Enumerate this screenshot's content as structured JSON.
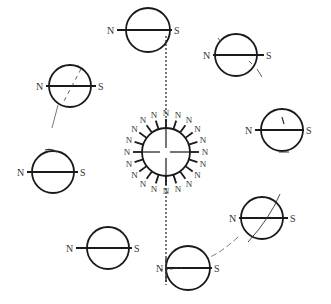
{
  "diagram": {
    "colors": {
      "stroke": "#1a1a1a",
      "text": "#333333",
      "background": "#ffffff"
    },
    "center_sphere": {
      "cx": 166,
      "cy": 152,
      "r": 24,
      "label": "N",
      "spoke_count": 20
    },
    "spheres": [
      {
        "id": "top-center",
        "cx": 148,
        "cy": 30,
        "r": 22,
        "n_label": "N",
        "s_label": "S",
        "n_x": 109,
        "s_x": 178
      },
      {
        "id": "upper-right",
        "cx": 236,
        "cy": 55,
        "r": 21,
        "n_label": "N",
        "s_label": "S",
        "n_x": 205,
        "s_x": 270
      },
      {
        "id": "upper-left",
        "cx": 70,
        "cy": 86,
        "r": 21,
        "n_label": "N",
        "s_label": "S",
        "n_x": 38,
        "s_x": 102
      },
      {
        "id": "right",
        "cx": 282,
        "cy": 130,
        "r": 21,
        "n_label": "N",
        "s_label": "S",
        "n_x": 247,
        "s_x": 310
      },
      {
        "id": "left",
        "cx": 53,
        "cy": 172,
        "r": 21,
        "n_label": "N",
        "s_label": "S",
        "n_x": 19,
        "s_x": 84
      },
      {
        "id": "lower-right",
        "cx": 262,
        "cy": 218,
        "r": 21,
        "n_label": "N",
        "s_label": "S",
        "n_x": 231,
        "s_x": 294
      },
      {
        "id": "lower-left",
        "cx": 108,
        "cy": 248,
        "r": 21,
        "n_label": "N",
        "s_label": "S",
        "n_x": 68,
        "s_x": 138
      },
      {
        "id": "bottom-center",
        "cx": 188,
        "cy": 268,
        "r": 22,
        "n_label": "N",
        "s_label": "S",
        "n_x": 158,
        "s_x": 218
      }
    ]
  }
}
